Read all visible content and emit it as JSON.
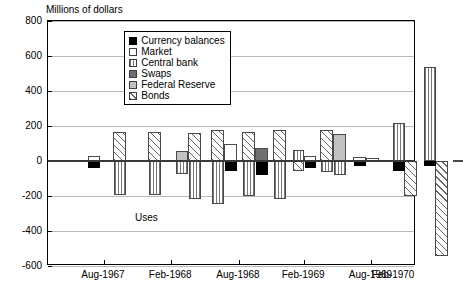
{
  "chart_data": {
    "type": "bar",
    "title": "",
    "ylabel": "Millions of dollars",
    "xlabel": "",
    "ylim": [
      -600,
      800
    ],
    "ytick_step": 200,
    "yticks": [
      800,
      600,
      400,
      200,
      0,
      -200,
      -400,
      -600
    ],
    "grid": true,
    "stacked": false,
    "legend_position": "top-center",
    "annotations": [
      {
        "text": "Sources",
        "x_frac": 0.27,
        "y_value": 330
      },
      {
        "text": "Uses",
        "x_frac": 0.27,
        "y_value": -330
      }
    ],
    "xticks": [
      "Aug-1967",
      "Feb-1968",
      "Aug-1968",
      "Feb-1969",
      "Aug-1969",
      "Feb-1970"
    ],
    "xtick_positions": [
      0.152,
      0.335,
      0.519,
      0.696,
      0.879,
      1.0
    ],
    "series": [
      {
        "name": "Currency balances",
        "key": "currency",
        "color": "#000000",
        "pattern": "solid-black"
      },
      {
        "name": "Market",
        "key": "market",
        "color": "#ffffff",
        "pattern": "empty"
      },
      {
        "name": "Central bank",
        "key": "central",
        "color": "#ffffff",
        "pattern": "vertical-lines"
      },
      {
        "name": "Swaps",
        "key": "swaps",
        "color": "#6f6f6f",
        "pattern": "solid-dark-gray"
      },
      {
        "name": "Federal Reserve",
        "key": "fed",
        "color": "#c2c2c2",
        "pattern": "solid-light-gray"
      },
      {
        "name": "Bonds",
        "key": "bonds",
        "color": "#ffffff",
        "pattern": "diagonal-hatch"
      }
    ],
    "bars": [
      {
        "series": "currency",
        "x_px": 40,
        "w_px": 12,
        "value": -40
      },
      {
        "series": "market",
        "x_px": 40,
        "w_px": 12,
        "value": 30
      },
      {
        "series": "bonds",
        "x_px": 65,
        "w_px": 13,
        "value": 165
      },
      {
        "series": "central",
        "x_px": 66,
        "w_px": 12,
        "value": -195
      },
      {
        "series": "bonds",
        "x_px": 100,
        "w_px": 13,
        "value": 165
      },
      {
        "series": "central",
        "x_px": 101,
        "w_px": 12,
        "value": -195
      },
      {
        "series": "fed",
        "x_px": 128,
        "w_px": 12,
        "value": 55
      },
      {
        "series": "central",
        "x_px": 128,
        "w_px": 12,
        "value": -75
      },
      {
        "series": "bonds",
        "x_px": 140,
        "w_px": 13,
        "value": 160
      },
      {
        "series": "central",
        "x_px": 141,
        "w_px": 12,
        "value": -215
      },
      {
        "series": "bonds",
        "x_px": 163,
        "w_px": 13,
        "value": 175
      },
      {
        "series": "central",
        "x_px": 164,
        "w_px": 12,
        "value": -245
      },
      {
        "series": "market",
        "x_px": 176,
        "w_px": 13,
        "value": 95
      },
      {
        "series": "currency",
        "x_px": 177,
        "w_px": 12,
        "value": -55
      },
      {
        "series": "bonds",
        "x_px": 194,
        "w_px": 13,
        "value": 165
      },
      {
        "series": "central",
        "x_px": 195,
        "w_px": 12,
        "value": -200
      },
      {
        "series": "swaps",
        "x_px": 207,
        "w_px": 13,
        "value": 75
      },
      {
        "series": "currency",
        "x_px": 208,
        "w_px": 12,
        "value": -80
      },
      {
        "series": "bonds",
        "x_px": 225,
        "w_px": 13,
        "value": 175
      },
      {
        "series": "central",
        "x_px": 226,
        "w_px": 12,
        "value": -215
      },
      {
        "series": "central",
        "x_px": 245,
        "w_px": 11,
        "value": 65
      },
      {
        "series": "bonds",
        "x_px": 245,
        "w_px": 11,
        "value": -55
      },
      {
        "series": "market",
        "x_px": 256,
        "w_px": 12,
        "value": 30
      },
      {
        "series": "currency",
        "x_px": 257,
        "w_px": 11,
        "value": -40
      },
      {
        "series": "bonds",
        "x_px": 272,
        "w_px": 13,
        "value": 175
      },
      {
        "series": "central",
        "x_px": 273,
        "w_px": 12,
        "value": -65
      },
      {
        "series": "fed",
        "x_px": 285,
        "w_px": 13,
        "value": 155
      },
      {
        "series": "central",
        "x_px": 286,
        "w_px": 12,
        "value": -80
      },
      {
        "series": "market",
        "x_px": 305,
        "w_px": 13,
        "value": 25
      },
      {
        "series": "currency",
        "x_px": 306,
        "w_px": 12,
        "value": -30
      },
      {
        "series": "market",
        "x_px": 318,
        "w_px": 13,
        "value": 15
      },
      {
        "series": "central",
        "x_px": 345,
        "w_px": 12,
        "value": 215
      },
      {
        "series": "currency",
        "x_px": 345,
        "w_px": 12,
        "value": -55
      },
      {
        "series": "bonds",
        "x_px": 356,
        "w_px": 13,
        "value": -200
      },
      {
        "series": "central",
        "x_px": 376,
        "w_px": 12,
        "value": 540
      },
      {
        "series": "currency",
        "x_px": 376,
        "w_px": 12,
        "value": -30
      },
      {
        "series": "bonds",
        "x_px": 387,
        "w_px": 13,
        "value": -540
      },
      {
        "series": "market",
        "x_px": 405,
        "w_px": 10,
        "value": 8
      }
    ]
  }
}
